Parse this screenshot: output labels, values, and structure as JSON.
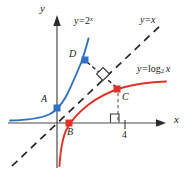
{
  "figure": {
    "axes": {
      "x_label": "x",
      "y_label": "y",
      "x_tick_labels": [
        "4"
      ],
      "y_tick_labels": [],
      "origin_px": [
        57,
        123
      ],
      "x_range_px": [
        8,
        165
      ],
      "y_range_px": [
        16,
        168
      ]
    },
    "curves": [
      {
        "name": "exponential",
        "label_y": "y",
        "label_eq": "=",
        "label_expr": "2",
        "label_exponent": "x",
        "label_text": "y = 2^x",
        "color": "#2f72c4",
        "style": "solid"
      },
      {
        "name": "logarithmic",
        "label_y": "y",
        "label_eq": "=",
        "label_func": "log",
        "label_base": "2",
        "label_arg": "x",
        "label_text": "y = log_2 x",
        "color": "#e03127",
        "style": "solid"
      },
      {
        "name": "identity-line",
        "label_y": "y",
        "label_eq": "=",
        "label_expr": "x",
        "label_text": "y = x",
        "color": "#242424",
        "style": "dashed"
      }
    ],
    "points": [
      {
        "id": "A",
        "label": "A",
        "color": "#2f72c4",
        "on_curve": "exponential",
        "px": [
          57,
          108
        ],
        "label_px": [
          43,
          97
        ]
      },
      {
        "id": "B",
        "label": "B",
        "color": "#e03127",
        "on_curve": "logarithmic",
        "px": [
          69,
          123
        ],
        "label_px": [
          68,
          128
        ]
      },
      {
        "id": "C",
        "label": "C",
        "color": "#e03127",
        "on_curve": "logarithmic",
        "px": [
          117,
          89
        ],
        "label_px": [
          121,
          91
        ]
      },
      {
        "id": "D",
        "label": "D",
        "color": "#2f72c4",
        "on_curve": "exponential",
        "px": [
          85,
          60
        ],
        "label_px": [
          70,
          53
        ]
      }
    ],
    "markers": [
      {
        "name": "perpendicular-diamond",
        "type": "right-angle-rotated",
        "px": [
          103,
          74
        ]
      },
      {
        "name": "right-angle-square",
        "type": "right-angle",
        "px": [
          116,
          117
        ]
      }
    ],
    "connector": {
      "name": "segment-D-to-C",
      "from": "D",
      "to": "C",
      "style": "dashed",
      "color": "#242424"
    },
    "colors": {
      "blue": "#2f72c4",
      "red": "#e03127",
      "axis": "#4a4a4a",
      "dash": "#242424",
      "text": "#1a1a1a",
      "background": "#ffffff"
    }
  }
}
